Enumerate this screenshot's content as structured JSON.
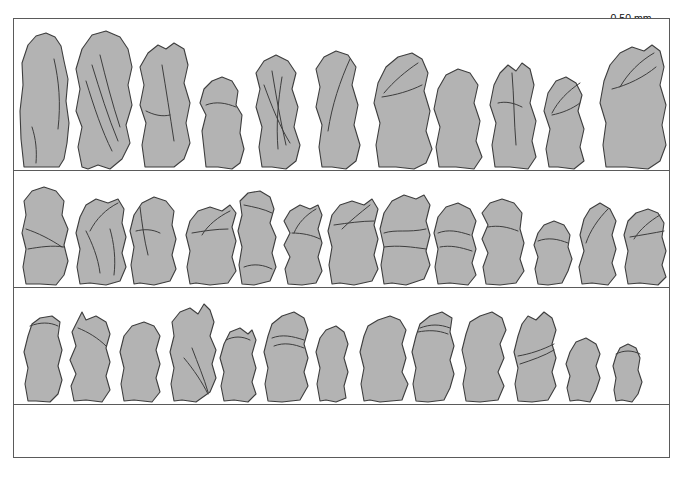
{
  "figure": {
    "title": "Icosium tomentosum",
    "caption_note": "",
    "background_color": "#ffffff",
    "frame_color": "#5a5a5a",
    "scale_fill_color": "#b3b3b3",
    "scale_outline_color": "#3d3d3d"
  },
  "scalebar": {
    "label": "0.50 mm",
    "segments": [
      "white",
      "black"
    ],
    "length_px": 66
  },
  "plate": {
    "rows": [
      {
        "row_index": 1,
        "specimen_count": 12,
        "specimens": [
          {
            "index": 1,
            "x": 5,
            "width": 50,
            "height": 130
          },
          {
            "index": 2,
            "x": 62,
            "width": 56,
            "height": 135
          },
          {
            "index": 3,
            "x": 128,
            "width": 50,
            "height": 120
          },
          {
            "index": 4,
            "x": 190,
            "width": 46,
            "height": 105
          },
          {
            "index": 5,
            "x": 245,
            "width": 52,
            "height": 112
          },
          {
            "index": 6,
            "x": 305,
            "width": 48,
            "height": 118
          },
          {
            "index": 7,
            "x": 362,
            "width": 52,
            "height": 120
          },
          {
            "index": 8,
            "x": 422,
            "width": 48,
            "height": 110
          },
          {
            "index": 9,
            "x": 478,
            "width": 46,
            "height": 112
          },
          {
            "index": 10,
            "x": 532,
            "width": 48,
            "height": 108
          },
          {
            "index": 11,
            "x": 590,
            "width": 52,
            "height": 122
          }
        ]
      },
      {
        "row_index": 2,
        "specimen_count": 14,
        "specimens": [
          {
            "index": 1,
            "x": 6,
            "width": 50,
            "height": 92
          },
          {
            "index": 2,
            "x": 62,
            "width": 48,
            "height": 86
          },
          {
            "index": 3,
            "x": 116,
            "width": 48,
            "height": 88
          },
          {
            "index": 4,
            "x": 172,
            "width": 46,
            "height": 80
          },
          {
            "index": 5,
            "x": 224,
            "width": 40,
            "height": 92
          },
          {
            "index": 6,
            "x": 270,
            "width": 38,
            "height": 78
          },
          {
            "index": 7,
            "x": 314,
            "width": 44,
            "height": 84
          },
          {
            "index": 8,
            "x": 366,
            "width": 48,
            "height": 92
          },
          {
            "index": 9,
            "x": 420,
            "width": 42,
            "height": 86
          },
          {
            "index": 10,
            "x": 468,
            "width": 46,
            "height": 90
          },
          {
            "index": 11,
            "x": 520,
            "width": 36,
            "height": 66
          },
          {
            "index": 12,
            "x": 562,
            "width": 40,
            "height": 80
          },
          {
            "index": 13,
            "x": 608,
            "width": 42,
            "height": 72
          }
        ]
      },
      {
        "row_index": 3,
        "specimen_count": 14,
        "specimens": [
          {
            "index": 1,
            "x": 8,
            "width": 38,
            "height": 84
          },
          {
            "index": 2,
            "x": 56,
            "width": 40,
            "height": 78
          },
          {
            "index": 3,
            "x": 106,
            "width": 40,
            "height": 74
          },
          {
            "index": 4,
            "x": 156,
            "width": 44,
            "height": 82
          },
          {
            "index": 5,
            "x": 206,
            "width": 36,
            "height": 72
          },
          {
            "index": 6,
            "x": 250,
            "width": 44,
            "height": 80
          },
          {
            "index": 7,
            "x": 304,
            "width": 32,
            "height": 66
          },
          {
            "index": 8,
            "x": 346,
            "width": 44,
            "height": 74
          },
          {
            "index": 9,
            "x": 398,
            "width": 40,
            "height": 78
          },
          {
            "index": 10,
            "x": 448,
            "width": 44,
            "height": 80
          },
          {
            "index": 11,
            "x": 500,
            "width": 44,
            "height": 82
          },
          {
            "index": 12,
            "x": 554,
            "width": 32,
            "height": 58
          },
          {
            "index": 13,
            "x": 598,
            "width": 26,
            "height": 50
          }
        ]
      },
      {
        "row_index": 4,
        "specimen_count": 0,
        "specimens": []
      }
    ],
    "row_dividers_y": [
      170,
      287,
      404
    ],
    "frame": {
      "x": 13,
      "y": 18,
      "width": 657,
      "height": 440
    }
  }
}
